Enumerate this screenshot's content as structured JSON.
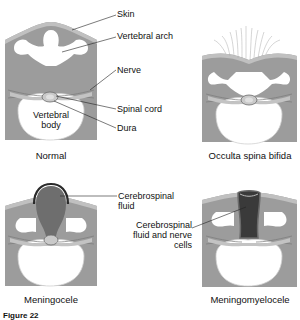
{
  "panels": {
    "normal": {
      "caption": "Normal",
      "labels": {
        "skin": "Skin",
        "vertebral_arch": "Vertebral arch",
        "nerve": "Nerve",
        "spinal_cord": "Spinal cord",
        "dura": "Dura",
        "vertebral_body": "Vertebral body"
      }
    },
    "occulta": {
      "caption": "Occulta spina bifida"
    },
    "meningocele": {
      "caption": "Meningocele",
      "labels": {
        "csf": "Cerebrospinal fluid"
      }
    },
    "meningomyelocele": {
      "caption": "Meningomyelocele",
      "labels": {
        "csf_nerve": "Cerebrospinal fluid and nerve cells"
      }
    }
  },
  "figure_label": "Figure 22",
  "colors": {
    "tissue": "#9c9c9c",
    "skin": "#b8b8b8",
    "bone": "#ffffff",
    "sac": "#6e6e6e",
    "sac_dark": "#3a3a3a",
    "cord": "#c9c9c9"
  }
}
